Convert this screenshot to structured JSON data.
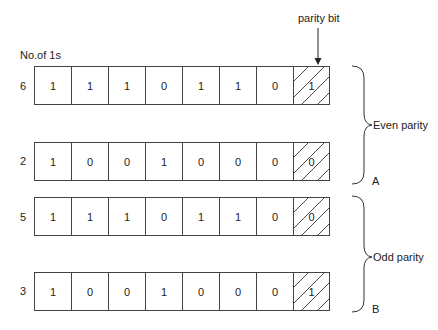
{
  "figure": {
    "column_header": "No.of 1s",
    "parity_bit_label": "parity bit",
    "groups": [
      {
        "name": "Even parity",
        "letter": "A",
        "rows": [
          {
            "count": "6",
            "bits": [
              "1",
              "1",
              "1",
              "0",
              "1",
              "1",
              "0"
            ],
            "parity": "1"
          },
          {
            "count": "2",
            "bits": [
              "1",
              "0",
              "0",
              "1",
              "0",
              "0",
              "0"
            ],
            "parity": "0"
          }
        ]
      },
      {
        "name": "Odd parity",
        "letter": "B",
        "rows": [
          {
            "count": "5",
            "bits": [
              "1",
              "1",
              "1",
              "0",
              "1",
              "1",
              "0"
            ],
            "parity": "0"
          },
          {
            "count": "3",
            "bits": [
              "1",
              "0",
              "0",
              "1",
              "0",
              "0",
              "0"
            ],
            "parity": "1"
          }
        ]
      }
    ]
  }
}
